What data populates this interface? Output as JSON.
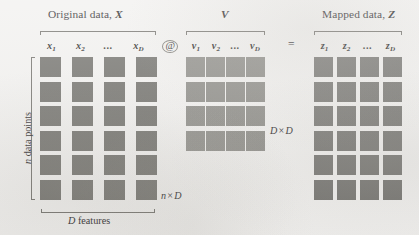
{
  "figure": {
    "kind": "matrix-multiplication-diagram",
    "background_color": "#f1f0ee",
    "blocks": [
      {
        "id": "X",
        "title_prefix": "Original data, ",
        "title_symbol": "X",
        "columns": [
          "x",
          "x",
          "x"
        ],
        "col_labels": [
          {
            "base": "x",
            "sub": "1"
          },
          {
            "base": "x",
            "sub": "2"
          },
          {
            "base": "x",
            "sub": "D"
          }
        ],
        "ellipsis": "...",
        "rows": 6,
        "cols": 4,
        "cell_color": "#6e6d68",
        "shape_label": {
          "rows": "n",
          "times": "×",
          "cols": "D"
        },
        "row_axis_label": {
          "count": "n",
          "noun": " data points"
        },
        "col_axis_label": {
          "count": "D",
          "noun": " features"
        }
      },
      {
        "id": "V",
        "title_prefix": "",
        "title_symbol": "V",
        "col_labels": [
          {
            "base": "v",
            "sub": "1"
          },
          {
            "base": "v",
            "sub": "2"
          },
          {
            "base": "v",
            "sub": "D"
          }
        ],
        "ellipsis": "...",
        "rows": 4,
        "cols": 4,
        "cell_color": "#8b8a85",
        "shape_label": {
          "rows": "D",
          "times": "×",
          "cols": "D"
        }
      },
      {
        "id": "Z",
        "title_prefix": "Mapped data, ",
        "title_symbol": "Z",
        "col_labels": [
          {
            "base": "z",
            "sub": "1"
          },
          {
            "base": "z",
            "sub": "2"
          },
          {
            "base": "z",
            "sub": "D"
          }
        ],
        "ellipsis": "...",
        "rows": 6,
        "cols": 4,
        "cell_color": "#757470"
      }
    ],
    "operators": {
      "matmul": "@",
      "equals": "="
    }
  },
  "chart_data": {
    "type": "diagram",
    "matrices": [
      {
        "name": "X",
        "label": "Original data, X",
        "rows_drawn": 6,
        "cols_drawn": 4,
        "shape": "n × D",
        "column_headers": [
          "x₁",
          "x₂",
          "...",
          "x_D"
        ],
        "row_axis": "n data points",
        "col_axis": "D features",
        "fill": "#6e6d68"
      },
      {
        "name": "V",
        "label": "V",
        "rows_drawn": 4,
        "cols_drawn": 4,
        "shape": "D × D",
        "column_headers": [
          "v₁",
          "v₂",
          "...",
          "v_D"
        ],
        "fill": "#8b8a85"
      },
      {
        "name": "Z",
        "label": "Mapped data, Z",
        "rows_drawn": 6,
        "cols_drawn": 4,
        "shape": "",
        "column_headers": [
          "z₁",
          "z₂",
          "...",
          "z_D"
        ],
        "fill": "#757470"
      }
    ],
    "operators": [
      "@",
      "="
    ],
    "equation": "X @ V = Z"
  }
}
